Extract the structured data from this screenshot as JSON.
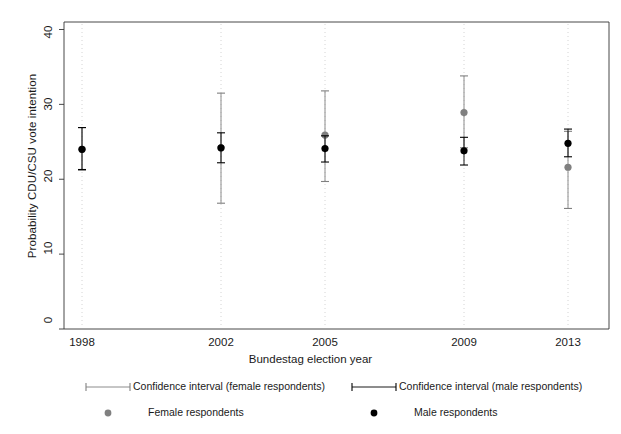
{
  "chart_data": {
    "type": "scatter",
    "title": "",
    "xlabel": "Bundestag election year",
    "ylabel": "Probability CDU/CSU vote intention",
    "categories": [
      "1998",
      "2002",
      "2005",
      "2009",
      "2013"
    ],
    "x": [
      1998,
      2002,
      2005,
      2009,
      2013
    ],
    "xtick_labels": [
      "1998",
      "2002",
      "2005",
      "2009",
      "2013"
    ],
    "ytick_labels": [
      "0",
      "10",
      "20",
      "30",
      "40"
    ],
    "yticks": [
      0,
      10,
      20,
      30,
      40
    ],
    "ylim": [
      0,
      41
    ],
    "grid": "vertical-dotted-at-categories",
    "legend_position": "below-axes",
    "series": [
      {
        "name": "Female respondents",
        "color": "#808080",
        "marker": "filled-circle",
        "values": [
          24.0,
          24.2,
          25.9,
          28.9,
          21.6
        ],
        "ci_low": [
          21.2,
          16.8,
          19.7,
          24.2,
          16.1
        ],
        "ci_high": [
          26.9,
          31.5,
          31.8,
          33.8,
          26.4
        ]
      },
      {
        "name": "Male respondents",
        "color": "#000000",
        "marker": "filled-circle",
        "values": [
          24.0,
          24.2,
          24.1,
          23.8,
          24.8
        ],
        "ci_low": [
          21.3,
          22.2,
          22.3,
          21.9,
          23.0
        ],
        "ci_high": [
          26.9,
          26.2,
          25.8,
          25.6,
          26.7
        ]
      }
    ],
    "legend_entries": [
      {
        "label": "Confidence interval (female respondents)",
        "type": "ci-bar",
        "color": "#808080"
      },
      {
        "label": "Confidence interval (male respondents)",
        "type": "ci-bar",
        "color": "#000000"
      },
      {
        "label": "Female respondents",
        "type": "point",
        "color": "#808080"
      },
      {
        "label": "Male respondents",
        "type": "point",
        "color": "#000000"
      }
    ]
  }
}
